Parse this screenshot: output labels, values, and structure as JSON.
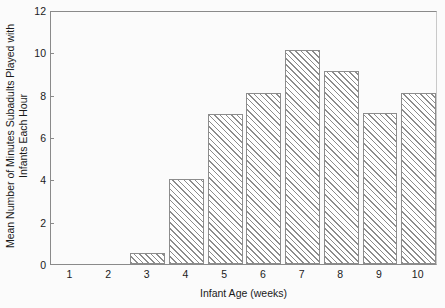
{
  "chart_data": {
    "type": "bar",
    "title": "",
    "xlabel": "Infant Age (weeks)",
    "ylabel": "Mean Number of Minutes Subadults Played with Infants Each Hour",
    "ylabel_line1": "Mean Number of Minutes Subadults Played with",
    "ylabel_line2": "Infants Each Hour",
    "categories": [
      "1",
      "2",
      "3",
      "4",
      "5",
      "6",
      "7",
      "8",
      "9",
      "10"
    ],
    "values": [
      0,
      0,
      0.5,
      4.0,
      7.1,
      8.1,
      10.1,
      9.1,
      7.15,
      8.1
    ],
    "ylim": [
      0,
      12
    ],
    "yticks": [
      "0",
      "2",
      "4",
      "6",
      "8",
      "10",
      "12"
    ],
    "ytick_values": [
      0,
      2,
      4,
      6,
      8,
      10,
      12
    ],
    "grid": false,
    "legend": "none",
    "bar_fill": "diagonal-hatch",
    "bar_edge_color": "#8c8c8c",
    "axis_color": "#8a8a8a",
    "background_color": "#fbfbfb",
    "text_color": "#1a1a1a"
  }
}
